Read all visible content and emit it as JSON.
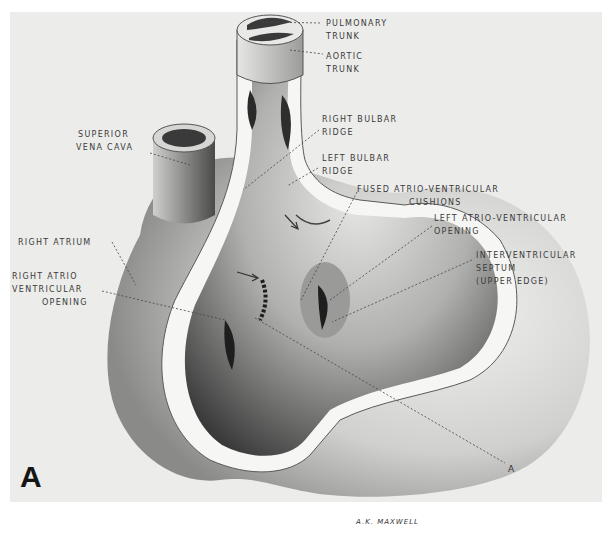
{
  "figure": {
    "panel_letter": "A",
    "signature": "A.K. MAXWELL",
    "section_marker": "A",
    "colors": {
      "background": "#ffffff",
      "panel": "#ececea",
      "label_text": "#3a3a3a",
      "leader_line": "#444444"
    },
    "labels": {
      "pulmonary_trunk": {
        "line1": "PULMONARY",
        "line2": "TRUNK"
      },
      "aortic_trunk": {
        "line1": "AORTIC",
        "line2": "TRUNK"
      },
      "superior_vena_cava": {
        "line1": "SUPERIOR",
        "line2": "VENA CAVA"
      },
      "right_bulbar_ridge": {
        "line1": "RIGHT BULBAR",
        "line2": "RIDGE"
      },
      "left_bulbar_ridge": {
        "line1": "LEFT BULBAR",
        "line2": "RIDGE"
      },
      "fused_av_cushions": {
        "line1": "FUSED ATRIO-VENTRICULAR",
        "line2": "CUSHIONS"
      },
      "left_av_opening": {
        "line1": "LEFT ATRIO-VENTRICULAR",
        "line2": "OPENING"
      },
      "interventricular_septum": {
        "line1": "INTERVENTRICULAR",
        "line2": "SEPTUM",
        "line3": "(UPPER EDGE)"
      },
      "right_atrium": {
        "line1": "RIGHT ATRIUM"
      },
      "right_av_opening": {
        "line1": "RIGHT ATRIO",
        "line2": "VENTRICULAR",
        "line3": "OPENING"
      }
    }
  }
}
